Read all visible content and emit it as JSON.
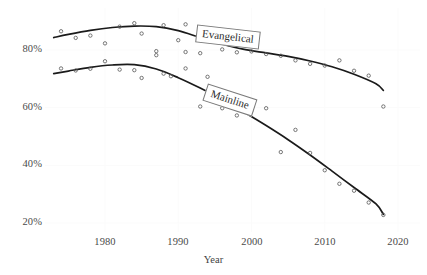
{
  "chart_data": {
    "type": "scatter",
    "title": "",
    "subtitle": "",
    "xlabel": "Year",
    "ylabel": "",
    "xlim": [
      1972,
      2021
    ],
    "ylim": [
      14,
      95
    ],
    "grid": true,
    "grid_color": "#fbfbfb",
    "legend_position": "inline-labels",
    "x_ticks": [
      1980,
      1990,
      2000,
      2010,
      2020
    ],
    "x_tick_labels": [
      "1980",
      "1990",
      "2000",
      "2010",
      "2020"
    ],
    "y_ticks": [
      20,
      40,
      60,
      80
    ],
    "y_tick_labels": [
      "20%",
      "40%",
      "60%",
      "80%"
    ],
    "marker_style": "open-circle",
    "marker_color": "#555555",
    "line_color": "#1a1a1a",
    "series": [
      {
        "name": "Evangelical",
        "label": "Evangelical",
        "label_x": 1998,
        "label_y": 80,
        "points": [
          {
            "x": 1974,
            "y": 86.5
          },
          {
            "x": 1976,
            "y": 84.2
          },
          {
            "x": 1978,
            "y": 85.0
          },
          {
            "x": 1980,
            "y": 82.3
          },
          {
            "x": 1982,
            "y": 88.1
          },
          {
            "x": 1984,
            "y": 89.3
          },
          {
            "x": 1985,
            "y": 85.7
          },
          {
            "x": 1987,
            "y": 79.6
          },
          {
            "x": 1988,
            "y": 88.6
          },
          {
            "x": 1990,
            "y": 83.4
          },
          {
            "x": 1991,
            "y": 88.9
          },
          {
            "x": 1991,
            "y": 79.3
          },
          {
            "x": 1993,
            "y": 78.9
          },
          {
            "x": 1994,
            "y": 87.0
          },
          {
            "x": 1996,
            "y": 80.2
          },
          {
            "x": 1998,
            "y": 79.2
          },
          {
            "x": 2000,
            "y": 79.5
          },
          {
            "x": 2002,
            "y": 78.6
          },
          {
            "x": 2004,
            "y": 78.0
          },
          {
            "x": 2006,
            "y": 76.4
          },
          {
            "x": 2008,
            "y": 75.2
          },
          {
            "x": 2010,
            "y": 74.6
          },
          {
            "x": 2012,
            "y": 76.4
          },
          {
            "x": 2014,
            "y": 72.8
          },
          {
            "x": 2016,
            "y": 71.1
          },
          {
            "x": 2018,
            "y": 60.4
          }
        ],
        "fit_curve": [
          {
            "x": 1973,
            "y": 84.3
          },
          {
            "x": 1975,
            "y": 85.4
          },
          {
            "x": 1978,
            "y": 86.8
          },
          {
            "x": 1981,
            "y": 87.8
          },
          {
            "x": 1984,
            "y": 88.3
          },
          {
            "x": 1987,
            "y": 88.1
          },
          {
            "x": 1990,
            "y": 86.7
          },
          {
            "x": 1993,
            "y": 84.3
          },
          {
            "x": 1996,
            "y": 82.0
          },
          {
            "x": 1999,
            "y": 80.2
          },
          {
            "x": 2002,
            "y": 79.0
          },
          {
            "x": 2005,
            "y": 77.8
          },
          {
            "x": 2008,
            "y": 76.2
          },
          {
            "x": 2011,
            "y": 74.2
          },
          {
            "x": 2014,
            "y": 71.6
          },
          {
            "x": 2017,
            "y": 68.3
          },
          {
            "x": 2018,
            "y": 66.0
          }
        ]
      },
      {
        "name": "Mainline",
        "label": "Mainline",
        "label_x": 1996,
        "label_y": 62,
        "points": [
          {
            "x": 1974,
            "y": 73.6
          },
          {
            "x": 1976,
            "y": 72.9
          },
          {
            "x": 1978,
            "y": 73.5
          },
          {
            "x": 1980,
            "y": 76.1
          },
          {
            "x": 1982,
            "y": 73.2
          },
          {
            "x": 1984,
            "y": 73.0
          },
          {
            "x": 1985,
            "y": 70.3
          },
          {
            "x": 1987,
            "y": 78.2
          },
          {
            "x": 1988,
            "y": 71.8
          },
          {
            "x": 1989,
            "y": 70.9
          },
          {
            "x": 1991,
            "y": 73.6
          },
          {
            "x": 1993,
            "y": 60.4
          },
          {
            "x": 1994,
            "y": 70.7
          },
          {
            "x": 1996,
            "y": 59.8
          },
          {
            "x": 1998,
            "y": 57.3
          },
          {
            "x": 2000,
            "y": 58.9
          },
          {
            "x": 2002,
            "y": 59.8
          },
          {
            "x": 2004,
            "y": 44.6
          },
          {
            "x": 2006,
            "y": 52.3
          },
          {
            "x": 2008,
            "y": 44.3
          },
          {
            "x": 2010,
            "y": 38.3
          },
          {
            "x": 2012,
            "y": 33.6
          },
          {
            "x": 2014,
            "y": 31.2
          },
          {
            "x": 2016,
            "y": 27.1
          },
          {
            "x": 2018,
            "y": 22.8
          }
        ],
        "fit_curve": [
          {
            "x": 1973,
            "y": 71.8
          },
          {
            "x": 1975,
            "y": 72.7
          },
          {
            "x": 1978,
            "y": 74.0
          },
          {
            "x": 1981,
            "y": 74.8
          },
          {
            "x": 1984,
            "y": 74.9
          },
          {
            "x": 1987,
            "y": 73.4
          },
          {
            "x": 1990,
            "y": 70.4
          },
          {
            "x": 1993,
            "y": 66.8
          },
          {
            "x": 1996,
            "y": 62.8
          },
          {
            "x": 1999,
            "y": 58.4
          },
          {
            "x": 2002,
            "y": 53.8
          },
          {
            "x": 2005,
            "y": 48.9
          },
          {
            "x": 2008,
            "y": 43.6
          },
          {
            "x": 2011,
            "y": 38.0
          },
          {
            "x": 2014,
            "y": 32.3
          },
          {
            "x": 2017,
            "y": 26.6
          },
          {
            "x": 2018,
            "y": 23.0
          }
        ]
      }
    ]
  }
}
